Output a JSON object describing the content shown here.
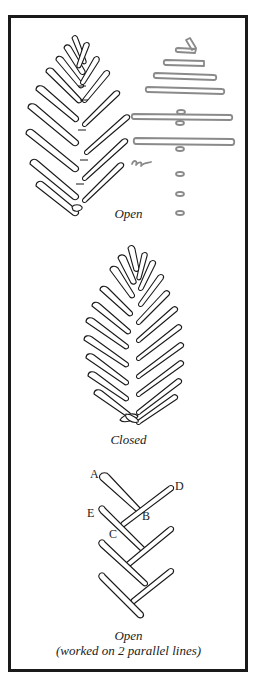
{
  "figure": {
    "panels": [
      {
        "caption": "Open"
      },
      {
        "caption": "Closed"
      },
      {
        "caption": "Open",
        "subcaption": "(worked on 2 parallel lines)"
      }
    ],
    "labels": {
      "A": "A",
      "B": "B",
      "C": "C",
      "D": "D",
      "E": "E"
    },
    "colors": {
      "ink": "#1a1a1a",
      "guide": "#8a8a8a",
      "background": "#ffffff"
    }
  }
}
